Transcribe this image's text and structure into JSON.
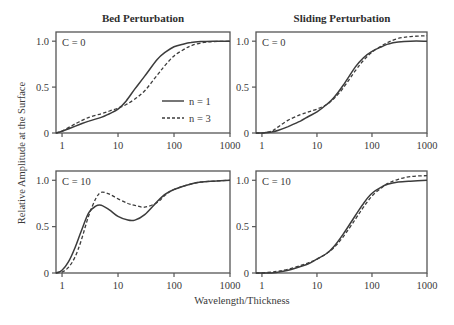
{
  "figure": {
    "column_titles": [
      "Bed Perturbation",
      "Sliding Perturbation"
    ],
    "ylabel": "Relative Amplitude at the Surface",
    "xlabel": "Wavelength/Thickness",
    "legend": [
      {
        "label": "n = 1",
        "style": "solid"
      },
      {
        "label": "n = 3",
        "style": "dashed"
      }
    ],
    "colors": {
      "line": "#3c3c3c",
      "axes": "#555555"
    }
  },
  "chart_data": [
    {
      "type": "line",
      "title": "Bed Perturbation",
      "annotation": "C = 0",
      "xscale": "log",
      "xlim": [
        0.78,
        1000
      ],
      "ylim": [
        0,
        1.1
      ],
      "xticks": [
        1,
        10,
        100,
        1000
      ],
      "xtick_labels": [
        "1",
        "10",
        "100",
        "1000"
      ],
      "yticks": [
        0,
        0.5,
        1.0
      ],
      "ytick_labels": [
        "0",
        "0.5",
        "1.0"
      ],
      "legend_position": "lower right",
      "series": [
        {
          "name": "n = 1",
          "style": "solid",
          "x": [
            0.78,
            1,
            1.5,
            2,
            3,
            5,
            7,
            10,
            14,
            20,
            30,
            50,
            70,
            100,
            150,
            200,
            300,
            500,
            1000
          ],
          "y": [
            0.0,
            0.02,
            0.06,
            0.09,
            0.13,
            0.17,
            0.21,
            0.26,
            0.35,
            0.48,
            0.62,
            0.8,
            0.88,
            0.94,
            0.97,
            0.985,
            0.995,
            1.0,
            1.0
          ]
        },
        {
          "name": "n = 3",
          "style": "dashed",
          "x": [
            0.78,
            1,
            1.5,
            2,
            3,
            5,
            7,
            10,
            14,
            20,
            30,
            50,
            70,
            100,
            150,
            200,
            300,
            500,
            1000
          ],
          "y": [
            0.0,
            0.02,
            0.08,
            0.12,
            0.17,
            0.21,
            0.24,
            0.27,
            0.31,
            0.37,
            0.46,
            0.63,
            0.74,
            0.84,
            0.91,
            0.95,
            0.98,
            0.995,
            1.0
          ]
        }
      ]
    },
    {
      "type": "line",
      "title": "Sliding Perturbation",
      "annotation": "C = 0",
      "xscale": "log",
      "xlim": [
        0.78,
        1000
      ],
      "ylim": [
        0,
        1.1
      ],
      "xticks": [
        1,
        10,
        100,
        1000
      ],
      "xtick_labels": [
        "1",
        "10",
        "100",
        "1000"
      ],
      "yticks": [
        0,
        0.5,
        1.0
      ],
      "ytick_labels": [
        "0",
        "0.5",
        "1.0"
      ],
      "series": [
        {
          "name": "n = 1",
          "style": "solid",
          "x": [
            0.78,
            1,
            1.5,
            2,
            3,
            5,
            7,
            10,
            15,
            20,
            30,
            50,
            70,
            100,
            150,
            200,
            300,
            500,
            1000
          ],
          "y": [
            0.0,
            0.0,
            0.01,
            0.03,
            0.07,
            0.13,
            0.18,
            0.23,
            0.31,
            0.38,
            0.52,
            0.72,
            0.82,
            0.89,
            0.94,
            0.97,
            0.99,
            1.0,
            1.0
          ]
        },
        {
          "name": "n = 3",
          "style": "dashed",
          "x": [
            0.78,
            1,
            1.5,
            2,
            3,
            5,
            7,
            10,
            15,
            20,
            30,
            50,
            70,
            100,
            150,
            200,
            300,
            500,
            1000
          ],
          "y": [
            0.0,
            0.0,
            0.02,
            0.07,
            0.14,
            0.2,
            0.23,
            0.26,
            0.31,
            0.37,
            0.49,
            0.68,
            0.79,
            0.88,
            0.95,
            0.99,
            1.03,
            1.05,
            1.06
          ]
        }
      ]
    },
    {
      "type": "line",
      "title": "Bed Perturbation",
      "annotation": "C = 10",
      "xscale": "log",
      "xlim": [
        0.78,
        1000
      ],
      "ylim": [
        0,
        1.1
      ],
      "xticks": [
        1,
        10,
        100,
        1000
      ],
      "xtick_labels": [
        "1",
        "10",
        "100",
        "1000"
      ],
      "yticks": [
        0,
        0.5,
        1.0
      ],
      "ytick_labels": [
        "0",
        "0.5",
        "1.0"
      ],
      "series": [
        {
          "name": "n = 1",
          "style": "solid",
          "x": [
            0.78,
            1,
            1.3,
            1.7,
            2.2,
            3,
            4,
            5,
            7,
            10,
            15,
            20,
            30,
            50,
            70,
            100,
            200,
            300,
            500,
            1000
          ],
          "y": [
            0.0,
            0.03,
            0.12,
            0.27,
            0.45,
            0.65,
            0.72,
            0.73,
            0.68,
            0.61,
            0.57,
            0.57,
            0.63,
            0.77,
            0.85,
            0.9,
            0.96,
            0.98,
            0.99,
            1.0
          ]
        },
        {
          "name": "n = 3",
          "style": "dashed",
          "x": [
            0.78,
            1,
            1.3,
            1.7,
            2.2,
            3,
            4,
            5,
            7,
            10,
            15,
            20,
            30,
            50,
            70,
            100,
            200,
            300,
            500,
            1000
          ],
          "y": [
            0.0,
            0.01,
            0.06,
            0.17,
            0.35,
            0.62,
            0.8,
            0.87,
            0.85,
            0.8,
            0.75,
            0.73,
            0.71,
            0.76,
            0.84,
            0.9,
            0.96,
            0.98,
            0.99,
            1.0
          ]
        }
      ]
    },
    {
      "type": "line",
      "title": "Sliding Perturbation",
      "annotation": "C = 10",
      "xscale": "log",
      "xlim": [
        0.78,
        1000
      ],
      "ylim": [
        0,
        1.1
      ],
      "xticks": [
        1,
        10,
        100,
        1000
      ],
      "xtick_labels": [
        "1",
        "10",
        "100",
        "1000"
      ],
      "yticks": [
        0,
        0.5,
        1.0
      ],
      "ytick_labels": [
        "0",
        "0.5",
        "1.0"
      ],
      "series": [
        {
          "name": "n = 1",
          "style": "solid",
          "x": [
            0.78,
            1,
            1.5,
            2,
            3,
            5,
            7,
            10,
            15,
            20,
            30,
            50,
            70,
            100,
            150,
            200,
            300,
            500,
            1000
          ],
          "y": [
            0.0,
            0.0,
            0.0,
            0.01,
            0.03,
            0.07,
            0.1,
            0.15,
            0.21,
            0.28,
            0.42,
            0.62,
            0.75,
            0.86,
            0.93,
            0.96,
            0.98,
            0.99,
            1.0
          ]
        },
        {
          "name": "n = 3",
          "style": "dashed",
          "x": [
            0.78,
            1,
            1.5,
            2,
            3,
            5,
            7,
            10,
            15,
            20,
            30,
            50,
            70,
            100,
            150,
            200,
            300,
            500,
            1000
          ],
          "y": [
            0.0,
            0.0,
            0.01,
            0.02,
            0.04,
            0.08,
            0.11,
            0.15,
            0.21,
            0.27,
            0.39,
            0.58,
            0.71,
            0.83,
            0.92,
            0.97,
            1.01,
            1.04,
            1.05
          ]
        }
      ]
    }
  ]
}
